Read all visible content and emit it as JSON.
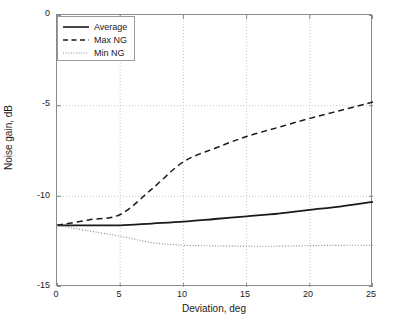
{
  "chart_data": {
    "type": "line",
    "title": "",
    "xlabel": "Deviation, deg",
    "ylabel": "Noise gain, dB",
    "xlim": [
      0,
      25
    ],
    "ylim": [
      -15,
      0
    ],
    "xticks": [
      "0",
      "5",
      "10",
      "15",
      "20",
      "25"
    ],
    "yticks": [
      "0",
      "-5",
      "-10",
      "-15"
    ],
    "grid": true,
    "legend_position": "upper-left-inside",
    "x": [
      0,
      2.5,
      5,
      7.5,
      10,
      12.5,
      15,
      17.5,
      20,
      22.5,
      25
    ],
    "series": [
      {
        "name": "Average",
        "style": "solid",
        "color": "#1a1a1a",
        "values": [
          -11.6,
          -11.6,
          -11.6,
          -11.5,
          -11.4,
          -11.25,
          -11.1,
          -10.95,
          -10.75,
          -10.55,
          -10.3
        ]
      },
      {
        "name": "Max NG",
        "style": "dashed",
        "color": "#1a1a1a",
        "values": [
          -11.6,
          -11.3,
          -11.0,
          -9.6,
          -8.1,
          -7.35,
          -6.7,
          -6.2,
          -5.7,
          -5.25,
          -4.8
        ]
      },
      {
        "name": "Min NG",
        "style": "dotted",
        "color": "#8c8c8c",
        "values": [
          -11.6,
          -11.9,
          -12.2,
          -12.55,
          -12.7,
          -12.73,
          -12.75,
          -12.75,
          -12.72,
          -12.7,
          -12.7
        ]
      }
    ]
  },
  "legend": {
    "entries": [
      {
        "label": "Average"
      },
      {
        "label": "Max NG"
      },
      {
        "label": "Min NG"
      }
    ]
  },
  "axes": {
    "x_title": "Deviation, deg",
    "y_title": "Noise gain, dB",
    "x_tick_labels": [
      "0",
      "5",
      "10",
      "15",
      "20",
      "25"
    ],
    "y_tick_labels": [
      "0",
      "-5",
      "-10",
      "-15"
    ]
  },
  "colors": {
    "frame": "#8a8a8a",
    "grid": "#b9b9b9",
    "average": "#1a1a1a",
    "max_ng": "#1a1a1a",
    "min_ng": "#8c8c8c",
    "background": "#ffffff"
  }
}
